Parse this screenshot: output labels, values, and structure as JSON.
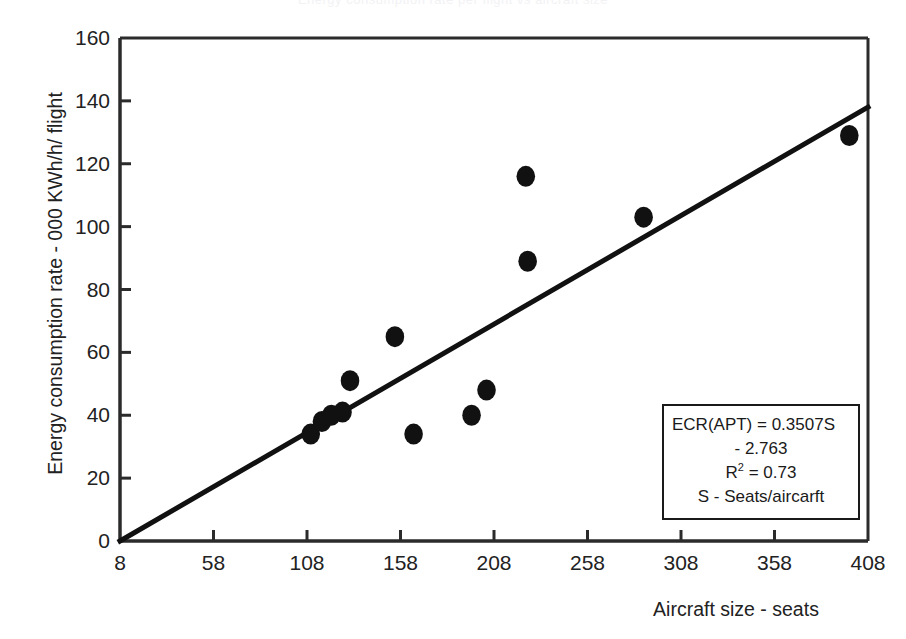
{
  "figure": {
    "clipped_title": "Energy consumption rate per flight vs aircraft size",
    "background_color": "#ffffff",
    "foreground_color": "#1a1a1a"
  },
  "axes": {
    "x_title": "Aircraft size - seats",
    "y_title": "Energy consumption  rate - 000 KWh/h/ flight",
    "x_ticks": [
      8,
      58,
      108,
      158,
      208,
      258,
      308,
      358,
      408
    ],
    "y_ticks": [
      0,
      20,
      40,
      60,
      80,
      100,
      120,
      140,
      160
    ],
    "x_tick_labels": [
      "8",
      "58",
      "108",
      "158",
      "208",
      "258",
      "308",
      "358",
      "408"
    ],
    "y_tick_labels": [
      "0",
      "20",
      "40",
      "60",
      "80",
      "100",
      "120",
      "140",
      "160"
    ],
    "x_min": 8,
    "x_max": 408,
    "y_min": 0,
    "y_max": 160
  },
  "annotation": {
    "line1": "ECR(APT) = 0.3507S",
    "line2": "- 2.763",
    "line3_prefix": "R",
    "line3_sup": "2",
    "line3_suffix": " = 0.73",
    "line4": "S - Seats/aircarft"
  },
  "chart_data": {
    "type": "scatter",
    "title": "",
    "xlabel": "Aircraft size - seats",
    "ylabel": "Energy consumption  rate - 000 KWh/h/ flight",
    "xlim": [
      8,
      408
    ],
    "ylim": [
      0,
      160
    ],
    "grid": false,
    "legend": "none",
    "marker": {
      "shape": "circle",
      "color": "#111111",
      "size": 15
    },
    "points": [
      {
        "x": 110,
        "y": 34
      },
      {
        "x": 116,
        "y": 38
      },
      {
        "x": 121,
        "y": 40
      },
      {
        "x": 127,
        "y": 41
      },
      {
        "x": 131,
        "y": 51
      },
      {
        "x": 155,
        "y": 65
      },
      {
        "x": 165,
        "y": 34
      },
      {
        "x": 196,
        "y": 40
      },
      {
        "x": 204,
        "y": 48
      },
      {
        "x": 225,
        "y": 116
      },
      {
        "x": 226,
        "y": 89
      },
      {
        "x": 288,
        "y": 103
      },
      {
        "x": 398,
        "y": 129
      }
    ],
    "trendline": {
      "type": "linear",
      "slope": 0.3507,
      "intercept": -2.763,
      "r_squared": 0.73,
      "equation": "ECR(APT) = 0.3507S - 2.763",
      "color": "#111111",
      "width": 5,
      "x_start": 8,
      "y_start": 0,
      "x_end": 408,
      "y_end": 138
    },
    "annotations": [
      "ECR(APT) = 0.3507S",
      "- 2.763",
      "R2 = 0.73",
      "S - Seats/aircarft"
    ]
  }
}
